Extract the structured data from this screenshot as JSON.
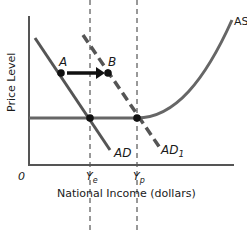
{
  "diagram": {
    "y_axis_label": "Price Level",
    "x_axis_label": "National Income (dollars)",
    "origin_label": "0",
    "x_ticks": {
      "ye": {
        "main": "Y",
        "sub": "e"
      },
      "yp": {
        "main": "Y",
        "sub": "p"
      }
    },
    "curves": {
      "ad": "AD",
      "ad1": {
        "main": "AD",
        "sub": "1"
      },
      "as": "AS"
    },
    "points": {
      "a": "A",
      "b": "B"
    },
    "colors": {
      "curve": "#555555",
      "axis": "#555555",
      "point": "#111111",
      "arrow": "#111111"
    }
  }
}
